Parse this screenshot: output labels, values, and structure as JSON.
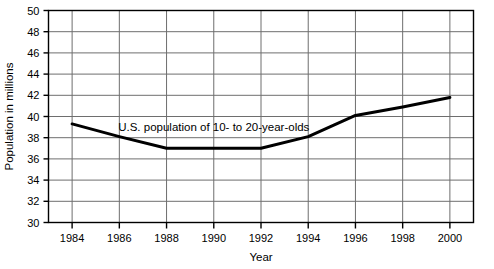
{
  "chart_data": {
    "type": "line",
    "title": "",
    "subtitle": "",
    "xlabel": "Year",
    "ylabel": "Population in millions",
    "xlim": [
      1983,
      2001
    ],
    "ylim": [
      30,
      50
    ],
    "grid": true,
    "legend_position": "none",
    "x": [
      1984,
      1986,
      1988,
      1990,
      1992,
      1994,
      1996,
      1998,
      2000
    ],
    "xticklabels": [
      "1984",
      "1986",
      "1988",
      "1990",
      "1992",
      "1994",
      "1996",
      "1998",
      "2000"
    ],
    "yticks": [
      30,
      32,
      34,
      36,
      38,
      40,
      42,
      44,
      46,
      48,
      50
    ],
    "yticklabels": [
      "30",
      "32",
      "34",
      "36",
      "38",
      "40",
      "42",
      "44",
      "46",
      "48",
      "50"
    ],
    "series": [
      {
        "name": "U.S. population of 10- to 20-year-olds",
        "values": [
          39.3,
          38.1,
          37.0,
          37.0,
          37.0,
          38.1,
          40.1,
          40.9,
          41.8
        ],
        "color": "#000000",
        "linewidth": 3
      }
    ],
    "annotations": [
      {
        "text": "U.S. population of 10- to 20-year-olds",
        "x": 1990.0,
        "y": 39.0
      }
    ]
  }
}
